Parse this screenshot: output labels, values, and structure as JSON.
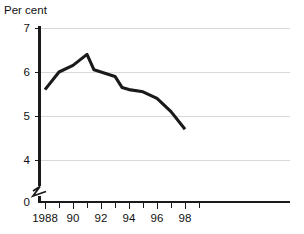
{
  "chart_data": {
    "type": "line",
    "title": "",
    "subtitle": "",
    "ylabel": "Per cent",
    "xlabel": "",
    "ylim": [
      0,
      7
    ],
    "y_axis_break": true,
    "y_break_between": [
      0,
      4
    ],
    "grid": "horizontal",
    "legend": "none",
    "y_ticks": [
      "7",
      "6",
      "5",
      "4",
      "0"
    ],
    "y_tick_values": [
      7,
      6,
      5,
      4,
      0
    ],
    "x_ticks": [
      "1988",
      "90",
      "92",
      "94",
      "96",
      "98"
    ],
    "x_tick_values": [
      1988,
      1990,
      1992,
      1994,
      1996,
      1998
    ],
    "x_minor_tick_values": [
      1987,
      1989,
      1991,
      1993,
      1995,
      1997,
      1999
    ],
    "xlim": [
      1987,
      1999
    ],
    "series": [
      {
        "name": "Per cent",
        "color": "#1a1a1a",
        "x": [
          1988,
          1989,
          1990,
          1991,
          1991.5,
          1992,
          1993,
          1993.5,
          1994,
          1995,
          1996,
          1997,
          1998
        ],
        "values": [
          5.6,
          6.0,
          6.15,
          6.4,
          6.05,
          6.0,
          5.9,
          5.65,
          5.6,
          5.55,
          5.4,
          5.1,
          4.7
        ]
      }
    ]
  },
  "axis": {
    "y_title": "Per cent"
  },
  "colors": {
    "line": "#1a1a1a",
    "grid": "#d9d9d9",
    "axis": "#1a1a1a",
    "background": "#ffffff"
  }
}
